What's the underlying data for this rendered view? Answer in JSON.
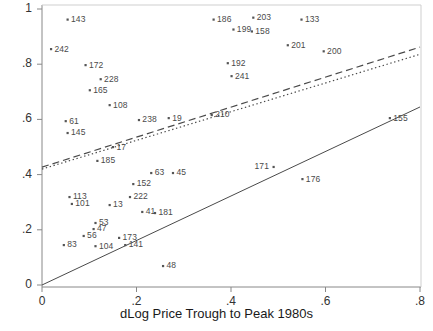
{
  "chart_data": {
    "type": "scatter",
    "title": "",
    "xlabel": "dLog Price Trough to Peak 1980s",
    "ylabel": "",
    "xlim": [
      -0.02,
      0.82
    ],
    "ylim": [
      -0.035,
      1.01
    ],
    "grid": false,
    "legend": "none",
    "xticks": [
      "0",
      ".2",
      ".4",
      ".6",
      ".8"
    ],
    "xtick_values": [
      0,
      0.2,
      0.4,
      0.6,
      0.8
    ],
    "yticks": [
      "0",
      ".2",
      ".4",
      ".6",
      ".8",
      "1"
    ],
    "ytick_values": [
      0,
      0.2,
      0.4,
      0.6,
      0.8,
      1
    ],
    "marker": "small-square",
    "point_label_position": "right-of-marker",
    "points": [
      {
        "label": "143",
        "x": 0.054,
        "y": 0.962
      },
      {
        "label": "186",
        "x": 0.363,
        "y": 0.962
      },
      {
        "label": "203",
        "x": 0.447,
        "y": 0.969
      },
      {
        "label": "133",
        "x": 0.549,
        "y": 0.962
      },
      {
        "label": "242",
        "x": 0.019,
        "y": 0.855
      },
      {
        "label": "199",
        "x": 0.405,
        "y": 0.926
      },
      {
        "label": "158",
        "x": 0.444,
        "y": 0.919
      },
      {
        "label": "172",
        "x": 0.092,
        "y": 0.797
      },
      {
        "label": "201",
        "x": 0.52,
        "y": 0.869
      },
      {
        "label": "200",
        "x": 0.596,
        "y": 0.847
      },
      {
        "label": "192",
        "x": 0.393,
        "y": 0.804
      },
      {
        "label": "228",
        "x": 0.124,
        "y": 0.746
      },
      {
        "label": "241",
        "x": 0.401,
        "y": 0.757
      },
      {
        "label": "165",
        "x": 0.101,
        "y": 0.706
      },
      {
        "label": "108",
        "x": 0.143,
        "y": 0.652
      },
      {
        "label": "210",
        "x": 0.359,
        "y": 0.616
      },
      {
        "label": "155",
        "x": 0.736,
        "y": 0.605
      },
      {
        "label": "238",
        "x": 0.205,
        "y": 0.598
      },
      {
        "label": "19",
        "x": 0.268,
        "y": 0.605
      },
      {
        "label": "61",
        "x": 0.05,
        "y": 0.594
      },
      {
        "label": "145",
        "x": 0.054,
        "y": 0.551
      },
      {
        "label": "17",
        "x": 0.15,
        "y": 0.5
      },
      {
        "label": "185",
        "x": 0.117,
        "y": 0.45
      },
      {
        "label": "171",
        "x": 0.49,
        "y": 0.428,
        "label_side": "left"
      },
      {
        "label": "63",
        "x": 0.231,
        "y": 0.406
      },
      {
        "label": "45",
        "x": 0.277,
        "y": 0.406
      },
      {
        "label": "176",
        "x": 0.551,
        "y": 0.384
      },
      {
        "label": "152",
        "x": 0.193,
        "y": 0.366
      },
      {
        "label": "222",
        "x": 0.186,
        "y": 0.319
      },
      {
        "label": "113",
        "x": 0.058,
        "y": 0.319
      },
      {
        "label": "101",
        "x": 0.063,
        "y": 0.294
      },
      {
        "label": "13",
        "x": 0.143,
        "y": 0.29
      },
      {
        "label": "41",
        "x": 0.212,
        "y": 0.265
      },
      {
        "label": "181",
        "x": 0.239,
        "y": 0.261
      },
      {
        "label": "53",
        "x": 0.113,
        "y": 0.225
      },
      {
        "label": "47",
        "x": 0.109,
        "y": 0.203
      },
      {
        "label": "56",
        "x": 0.088,
        "y": 0.178
      },
      {
        "label": "173",
        "x": 0.163,
        "y": 0.171
      },
      {
        "label": "83",
        "x": 0.046,
        "y": 0.145
      },
      {
        "label": "104",
        "x": 0.113,
        "y": 0.141
      },
      {
        "label": "141",
        "x": 0.176,
        "y": 0.145
      },
      {
        "label": "48",
        "x": 0.256,
        "y": 0.069
      }
    ],
    "lines": [
      {
        "name": "dashed-fit-line",
        "style": "dashed",
        "x0": 0.0,
        "y0": 0.427,
        "x1": 0.8,
        "y1": 0.862
      },
      {
        "name": "dotted-fit-line",
        "style": "dotted",
        "x0": 0.0,
        "y0": 0.42,
        "x1": 0.8,
        "y1": 0.836
      },
      {
        "name": "solid-fit-line",
        "style": "solid",
        "x0": 0.0,
        "y0": 0.0,
        "x1": 0.8,
        "y1": 0.645
      }
    ]
  }
}
